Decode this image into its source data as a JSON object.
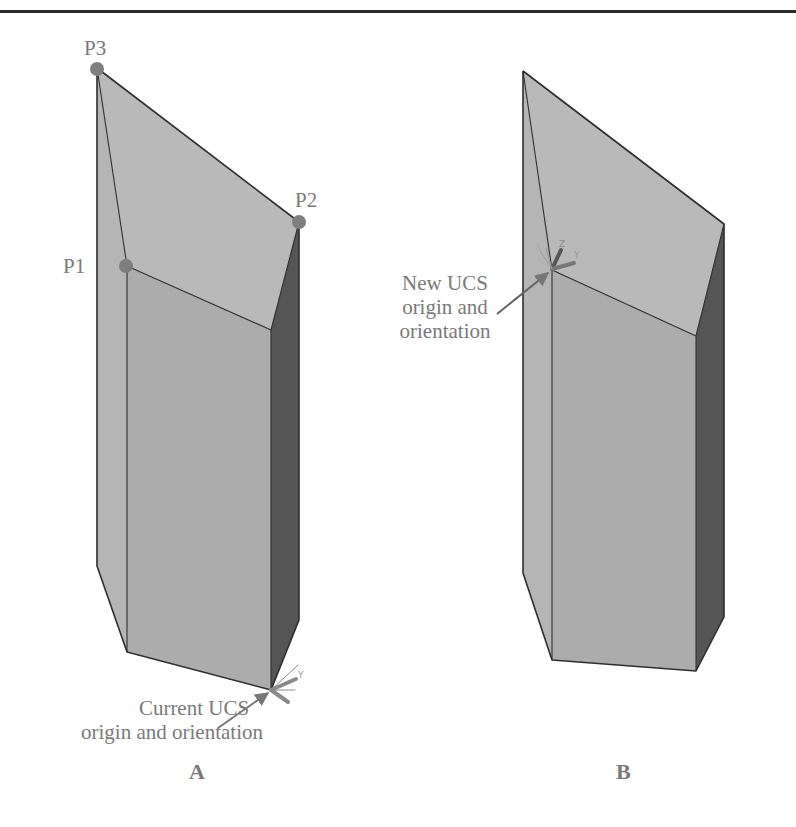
{
  "figures": [
    {
      "id": "A",
      "caption": "A",
      "points": [
        {
          "label": "P1"
        },
        {
          "label": "P2"
        },
        {
          "label": "P3"
        }
      ],
      "callout": {
        "line1": "Current UCS",
        "line2": "origin and orientation"
      },
      "ucs_icon": {
        "axes": [
          "X",
          "Y"
        ]
      }
    },
    {
      "id": "B",
      "caption": "B",
      "callout": {
        "line1": "New UCS",
        "line2": "origin and",
        "line3": "orientation"
      },
      "ucs_icon": {
        "axes": [
          "X",
          "Y",
          "Z"
        ]
      }
    }
  ],
  "colors": {
    "top_face": "#b9b9b9",
    "left_face": "#b5b5b5",
    "front_face": "#acacac",
    "right_face": "#555555",
    "edge": "#2e2e2e",
    "point_marker": "#7e7e7e",
    "label_text": "#7a7a7a",
    "arrow": "#777777"
  }
}
